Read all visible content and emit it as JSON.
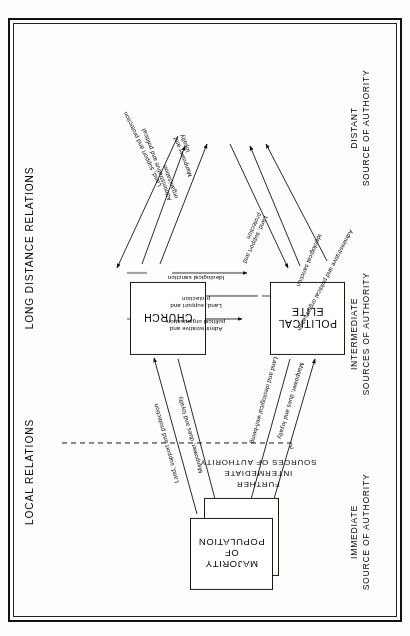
{
  "diagram": {
    "boxes": [
      {
        "id": "state",
        "label": "STATE"
      },
      {
        "id": "church",
        "label": "CHURCH"
      },
      {
        "id": "elite",
        "label": "POLITICAL\nELITE"
      },
      {
        "id": "population",
        "label": "MAJORITY\nOF\nPOPULATION"
      }
    ],
    "side_labels": {
      "left_top": "LONG DISTANCE RELATIONS",
      "left_bottom": "LOCAL RELATIONS",
      "right_top": "DISTANT\nSOURCE OF AUTHORITY",
      "right_middle": "INTERMEDIATE\nSOURCES OF AUTHORITY",
      "right_bottom": "IMMEDIATE\nSOURCE OF AUTHORITY"
    },
    "dashed_annotation": {
      "marker": "?",
      "text": "FURTHER\nINTERMEDIATE\nSOURCES OF  AUTHORITY"
    },
    "connections": {
      "church_to_state_outer": "Administrative and political organisation",
      "church_to_state_mid": "Ideological sanction",
      "state_to_church_inner": "Land, support and\nprotection",
      "elite_to_state_inner": "Manpower and\nloyalty",
      "elite_to_state_mid": "Administrative and political\norganisation",
      "state_to_elite_outer": "Land, support and protection",
      "church_to_elite_top": "Ideological sanction",
      "elite_to_church_mid": "Land, support and\nprotection",
      "church_to_elite_bottom": "Administrative and\npolitical organisation",
      "pop_to_church_outer": "Manpower, dues and loyalty",
      "church_to_pop_inner": "Land and ideological well-being",
      "pop_to_elite_inner": "Manpower, dues and loyalty",
      "elite_to_pop_outer": "Land, support and protection"
    }
  }
}
